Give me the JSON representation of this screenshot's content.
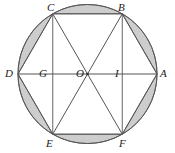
{
  "figure": {
    "type": "geometry-diagram",
    "canvas": {
      "width": 175,
      "height": 153
    },
    "circle": {
      "cx": 87.5,
      "cy": 74,
      "r": 69.5
    },
    "stroke_color": "#555555",
    "shade_color": "#cdcdcd",
    "label_color": "#1a1a1a",
    "background": "#ffffff",
    "points": [
      {
        "id": "A",
        "label": "A",
        "x": 157,
        "y": 74,
        "label_x": 160,
        "label_y": 68
      },
      {
        "id": "B",
        "label": "B",
        "x": 122.25,
        "y": 13.8,
        "label_x": 118,
        "label_y": 2
      },
      {
        "id": "C",
        "label": "C",
        "x": 52.75,
        "y": 13.8,
        "label_x": 47,
        "label_y": 2
      },
      {
        "id": "D",
        "label": "D",
        "x": 18,
        "y": 74,
        "label_x": 5,
        "label_y": 68
      },
      {
        "id": "E",
        "label": "E",
        "x": 52.75,
        "y": 134.2,
        "label_x": 46,
        "label_y": 138
      },
      {
        "id": "F",
        "label": "F",
        "x": 122.25,
        "y": 134.2,
        "label_x": 119,
        "label_y": 138
      },
      {
        "id": "O",
        "label": "O",
        "x": 87.5,
        "y": 74,
        "label_x": 76,
        "label_y": 68
      },
      {
        "id": "G",
        "label": "G",
        "x": 52.75,
        "y": 74,
        "label_x": 39,
        "label_y": 68
      },
      {
        "id": "I",
        "label": "I",
        "x": 122.25,
        "y": 74,
        "label_x": 114,
        "label_y": 68
      }
    ],
    "segments": [
      {
        "name": "hexagon-side-CB",
        "from": "C",
        "to": "B"
      },
      {
        "name": "hexagon-side-BA",
        "from": "B",
        "to": "A"
      },
      {
        "name": "hexagon-side-AF",
        "from": "A",
        "to": "F"
      },
      {
        "name": "hexagon-side-FE",
        "from": "F",
        "to": "E"
      },
      {
        "name": "hexagon-side-ED",
        "from": "E",
        "to": "D"
      },
      {
        "name": "hexagon-side-DC",
        "from": "D",
        "to": "C"
      },
      {
        "name": "diameter-DA",
        "from": "D",
        "to": "A"
      },
      {
        "name": "chord-CE",
        "from": "C",
        "to": "E"
      },
      {
        "name": "chord-BF",
        "from": "B",
        "to": "F"
      },
      {
        "name": "diagonal-CF",
        "from": "C",
        "to": "F"
      },
      {
        "name": "diagonal-BE",
        "from": "B",
        "to": "E"
      }
    ],
    "shaded_segments": [
      {
        "name": "segment-CB-top",
        "from": "C",
        "to": "B"
      },
      {
        "name": "segment-BA-upper-right",
        "from": "B",
        "to": "A"
      },
      {
        "name": "segment-AF-lower-right",
        "from": "A",
        "to": "F"
      },
      {
        "name": "segment-FE-bottom",
        "from": "F",
        "to": "E"
      },
      {
        "name": "segment-ED-lower-left",
        "from": "E",
        "to": "D"
      },
      {
        "name": "segment-DC-upper-left",
        "from": "D",
        "to": "C"
      }
    ]
  }
}
